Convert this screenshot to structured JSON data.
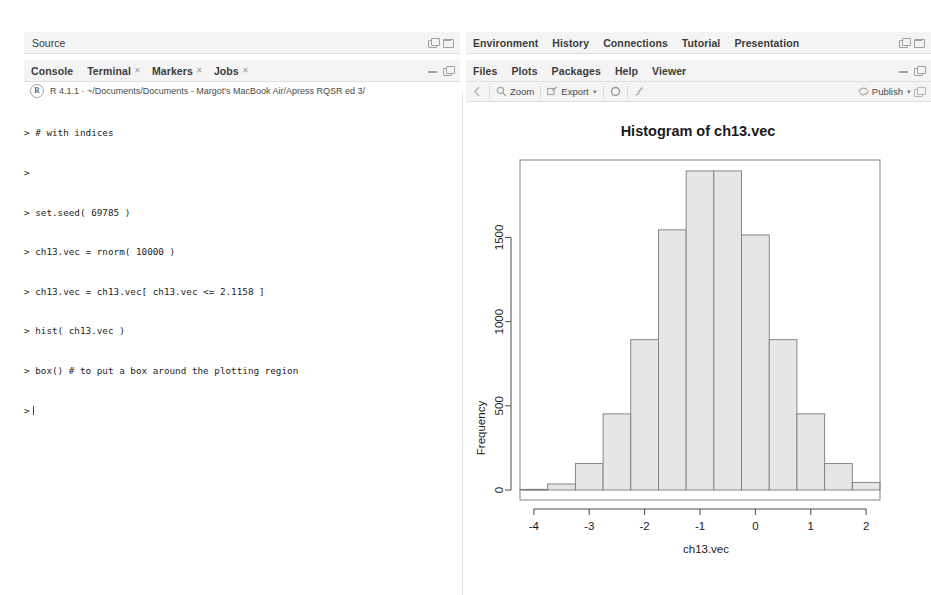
{
  "source_panel": {
    "title": "Source",
    "window_icons": [
      "restore-icon",
      "maximize-icon"
    ]
  },
  "console_panel": {
    "tabs": [
      {
        "label": "Console",
        "closable": false
      },
      {
        "label": "Terminal",
        "closable": true
      },
      {
        "label": "Markers",
        "closable": true
      },
      {
        "label": "Jobs",
        "closable": true
      }
    ],
    "window_icons": [
      "minimize-icon",
      "restore-icon"
    ],
    "r_logo": "R",
    "session_info": "R 4.1.1 · ~/Documents/Documents - Margot's MacBook Air/Apress RQSR ed 3/",
    "lines": [
      "> # with indices",
      ">",
      "> set.seed( 69785 )",
      "> ch13.vec = rnorm( 10000 )",
      "> ch13.vec = ch13.vec[ ch13.vec <= 2.1158 ]",
      "> hist( ch13.vec )",
      "> box() # to put a box around the plotting region",
      ">"
    ]
  },
  "environment_panel": {
    "tabs": [
      "Environment",
      "History",
      "Connections",
      "Tutorial",
      "Presentation"
    ],
    "window_icons": [
      "restore-icon",
      "maximize-icon"
    ]
  },
  "plots_panel": {
    "tabs": [
      "Files",
      "Plots",
      "Packages",
      "Help",
      "Viewer"
    ],
    "window_icons": [
      "minimize-icon",
      "restore-icon"
    ],
    "toolbar": {
      "back_label": "",
      "zoom_label": "Zoom",
      "export_label": "Export",
      "remove_label": "",
      "clear_label": "",
      "publish_label": "Publish"
    }
  },
  "chart_data": {
    "type": "bar",
    "title": "Histogram of ch13.vec",
    "xlabel": "ch13.vec",
    "ylabel": "Frequency",
    "grid": false,
    "xlim": [
      -4.25,
      2.25
    ],
    "ylim": [
      0,
      1960
    ],
    "xticks": [
      -4,
      -3,
      -2,
      -1,
      0,
      1,
      2
    ],
    "yticks": [
      0,
      500,
      1000,
      1500
    ],
    "bin_width": 0.5,
    "bin_edges": [
      -4.25,
      -3.75,
      -3.25,
      -2.75,
      -2.25,
      -1.75,
      -1.25,
      -0.75,
      -0.25,
      0.25,
      0.75,
      1.25,
      1.75,
      2.25
    ],
    "categories": [
      "-4.25–-3.75",
      "-3.75–-3.25",
      "-3.25–-2.75",
      "-2.75–-2.25",
      "-2.25–-1.75",
      "-1.75–-1.25",
      "-1.25–-0.75",
      "-0.75–-0.25",
      "-0.25–0.25",
      "0.25–0.75",
      "0.75–1.25",
      "1.25–1.75",
      "1.75–2.25"
    ],
    "values": [
      4,
      36,
      157,
      452,
      893,
      1545,
      1895,
      1895,
      1515,
      893,
      452,
      157,
      45
    ]
  }
}
